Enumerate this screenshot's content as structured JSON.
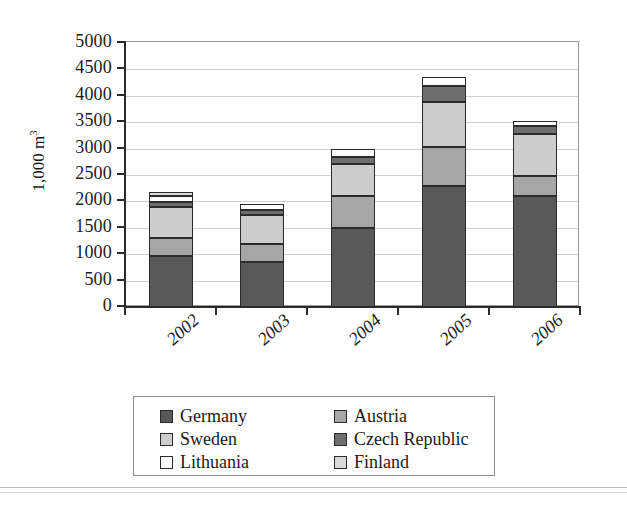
{
  "chart_data": {
    "type": "bar",
    "subtype": "stacked-bar",
    "title": "",
    "xlabel": "",
    "ylabel": "1,000 m³",
    "ylim": [
      0,
      5000
    ],
    "ytick_step": 500,
    "ytick_labels": [
      "5000",
      "4500",
      "4000",
      "3500",
      "3000",
      "2500",
      "2000",
      "1500",
      "1000",
      "500",
      "0"
    ],
    "grid": true,
    "legend_position": "bottom",
    "categories": [
      "2002",
      "2003",
      "2004",
      "2005",
      "2006"
    ],
    "series": [
      {
        "name": "Germany",
        "color": "#595959",
        "values": [
          960,
          850,
          1500,
          2300,
          2100
        ]
      },
      {
        "name": "Austria",
        "color": "#a6a6a6",
        "values": [
          350,
          350,
          600,
          730,
          380
        ]
      },
      {
        "name": "Sweden",
        "color": "#cccccc",
        "values": [
          580,
          550,
          600,
          850,
          800
        ]
      },
      {
        "name": "Czech Republic",
        "color": "#6e6e6e",
        "values": [
          90,
          80,
          150,
          300,
          150
        ]
      },
      {
        "name": "Lithuania",
        "color": "#ffffff",
        "values": [
          130,
          120,
          150,
          170,
          100
        ]
      },
      {
        "name": "Finland",
        "color": "#d9d9d9",
        "values": [
          70,
          0,
          0,
          0,
          0
        ]
      }
    ],
    "totals": [
      2180,
      1950,
      3000,
      4350,
      3530
    ]
  },
  "axis": {
    "y_title": "1,000 m",
    "y_title_exponent": "3"
  },
  "legend": {
    "left_column": [
      {
        "label": "Germany",
        "swatch": "#595959"
      },
      {
        "label": "Sweden",
        "swatch": "#cccccc"
      },
      {
        "label": "Lithuania",
        "swatch": "#ffffff"
      }
    ],
    "right_column": [
      {
        "label": "Austria",
        "swatch": "#a6a6a6"
      },
      {
        "label": "Czech Republic",
        "swatch": "#6e6e6e"
      },
      {
        "label": "Finland",
        "swatch": "#d9d9d9"
      }
    ]
  }
}
